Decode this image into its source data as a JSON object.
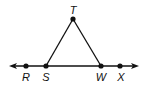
{
  "diagram": {
    "type": "geometry",
    "line": {
      "name": "line RX",
      "endpoints": {
        "left_arrow": [
          10,
          66
        ],
        "right_arrow": [
          138,
          66
        ]
      }
    },
    "points": [
      {
        "label": "T",
        "x": 73,
        "y": 19,
        "label_x": 73,
        "label_y": 15
      },
      {
        "label": "R",
        "x": 26,
        "y": 66,
        "label_x": 26,
        "label_y": 81
      },
      {
        "label": "S",
        "x": 46,
        "y": 66,
        "label_x": 46,
        "label_y": 81
      },
      {
        "label": "W",
        "x": 101,
        "y": 66,
        "label_x": 101,
        "label_y": 81
      },
      {
        "label": "X",
        "x": 120,
        "y": 66,
        "label_x": 121,
        "label_y": 81
      }
    ],
    "segments": [
      {
        "from": "S",
        "to": "T"
      },
      {
        "from": "T",
        "to": "W"
      }
    ],
    "colors": {
      "stroke": "#111111",
      "background": "#ffffff"
    }
  }
}
